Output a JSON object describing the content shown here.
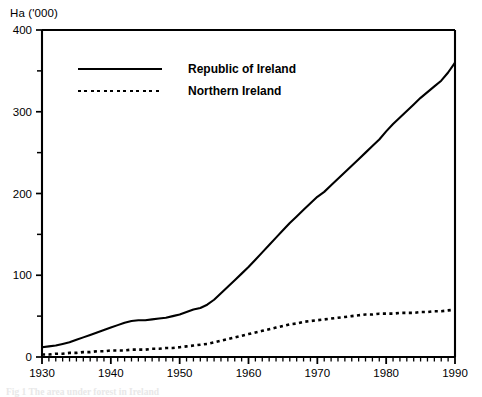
{
  "chart_data": {
    "type": "line",
    "title": "",
    "subtitle": "",
    "xlabel": "",
    "ylabel": "Ha ('000)",
    "ylim": [
      0,
      400
    ],
    "xlim": [
      1930,
      1990
    ],
    "grid": false,
    "legend_position": "inside-upper-left",
    "y_ticks_major": [
      0,
      100,
      200,
      300,
      400
    ],
    "y_ticks_minor": [
      50,
      150,
      250,
      350
    ],
    "x_ticks_major": [
      1930,
      1940,
      1950,
      1960,
      1970,
      1980,
      1990
    ],
    "x_tick_minor_step": 1,
    "y_tick_labels": [
      "0",
      "100",
      "200",
      "300",
      "400"
    ],
    "x_tick_labels": [
      "1930",
      "1940",
      "1950",
      "1960",
      "1970",
      "1980",
      "1990"
    ],
    "x": [
      1930,
      1931,
      1932,
      1933,
      1934,
      1935,
      1936,
      1937,
      1938,
      1939,
      1940,
      1941,
      1942,
      1943,
      1944,
      1945,
      1946,
      1947,
      1948,
      1949,
      1950,
      1951,
      1952,
      1953,
      1954,
      1955,
      1956,
      1957,
      1958,
      1959,
      1960,
      1961,
      1962,
      1963,
      1964,
      1965,
      1966,
      1967,
      1968,
      1969,
      1970,
      1971,
      1972,
      1973,
      1974,
      1975,
      1976,
      1977,
      1978,
      1979,
      1980,
      1981,
      1982,
      1983,
      1984,
      1985,
      1986,
      1987,
      1988,
      1989,
      1990
    ],
    "series": [
      {
        "name": "Republic of Ireland",
        "style": "solid",
        "color": "#000000",
        "values": [
          12,
          13,
          14,
          16,
          18,
          21,
          24,
          27,
          30,
          33,
          36,
          39,
          42,
          44,
          45,
          45,
          46,
          47,
          48,
          50,
          52,
          55,
          58,
          60,
          64,
          70,
          78,
          86,
          94,
          102,
          110,
          119,
          128,
          137,
          146,
          155,
          164,
          172,
          180,
          188,
          196,
          202,
          210,
          218,
          226,
          234,
          242,
          250,
          258,
          266,
          276,
          285,
          293,
          301,
          309,
          317,
          324,
          331,
          338,
          348,
          360
        ]
      },
      {
        "name": "Northern Ireland",
        "style": "dotted",
        "color": "#000000",
        "values": [
          3,
          3,
          4,
          4,
          5,
          5,
          6,
          6,
          7,
          7,
          8,
          8,
          8,
          9,
          9,
          9,
          10,
          10,
          11,
          11,
          12,
          13,
          14,
          15,
          16,
          18,
          20,
          22,
          24,
          26,
          28,
          30,
          32,
          34,
          36,
          38,
          40,
          41,
          43,
          44,
          45,
          46,
          47,
          48,
          49,
          50,
          51,
          52,
          52,
          53,
          53,
          53,
          54,
          54,
          54,
          55,
          55,
          56,
          56,
          57,
          58
        ]
      }
    ]
  },
  "legend": {
    "entries": [
      {
        "label": "Republic of Ireland",
        "style": "solid"
      },
      {
        "label": "Northern Ireland",
        "style": "dotted"
      }
    ]
  },
  "caption": {
    "text": "Fig 1  The area under forest in Ireland"
  }
}
